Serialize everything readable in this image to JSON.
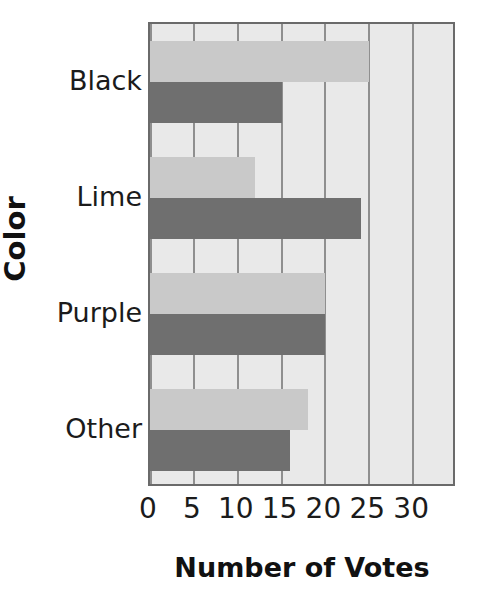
{
  "chart_data": {
    "type": "bar",
    "orientation": "horizontal",
    "title": "",
    "xlabel": "Number of Votes",
    "ylabel": "Color",
    "categories": [
      "Black",
      "Lime",
      "Purple",
      "Other"
    ],
    "series": [
      {
        "name": "light",
        "color": "#c9c9c9",
        "values": [
          25,
          12,
          20,
          18
        ]
      },
      {
        "name": "dark",
        "color": "#6f6f6f",
        "values": [
          15,
          24,
          20,
          16
        ]
      }
    ],
    "xlim": [
      0,
      35
    ],
    "xticks": [
      0,
      5,
      10,
      15,
      20,
      25,
      30
    ],
    "xtick_labels": [
      "0",
      "5",
      "10",
      "15",
      "20",
      "25",
      "30"
    ],
    "gridlines": [
      0,
      5,
      10,
      15,
      20,
      25,
      30
    ],
    "grid": true,
    "legend": "none",
    "plot_background": "#e9e9e9",
    "axis_border_color": "#6a6a6a",
    "gridline_color": "#8f8f8f"
  }
}
